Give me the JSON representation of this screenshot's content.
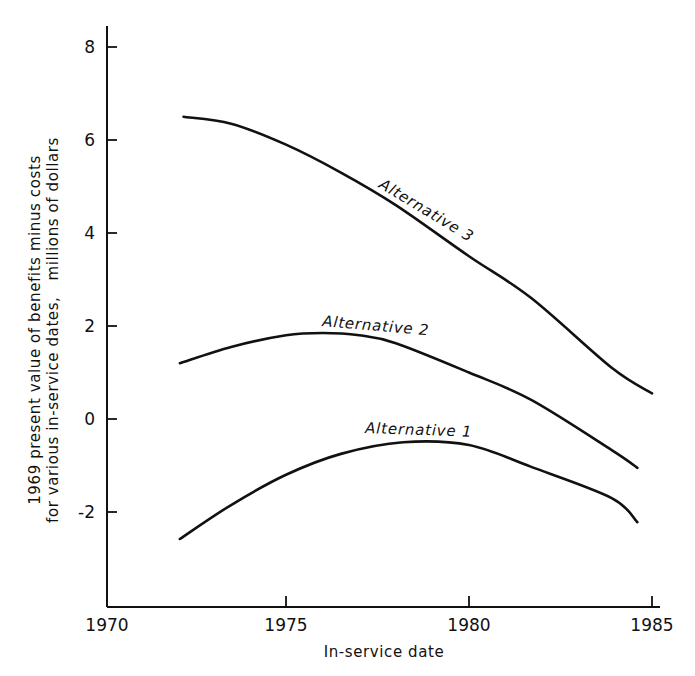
{
  "chart_data": {
    "type": "line",
    "title": "",
    "xlabel": "In-service date",
    "ylabel": [
      "1969 present value of benefits minus costs",
      "for various in-service dates,   millions of dollars"
    ],
    "xlim": [
      1970,
      1985
    ],
    "ylim": [
      -4,
      8.5
    ],
    "x_ticks": [
      1970,
      1975,
      1980,
      1985
    ],
    "x_tick_labels": [
      "1970",
      "1975",
      "1980",
      "1985"
    ],
    "y_ticks": [
      8,
      6,
      4,
      2,
      0,
      -2
    ],
    "y_tick_labels": [
      "8",
      "6",
      "4",
      "2",
      "0",
      "-2"
    ],
    "grid": false,
    "legend": "inline labels on curves",
    "series": [
      {
        "name": "Alternative 3",
        "x": [
          1972.2,
          1973.5,
          1975.0,
          1976.5,
          1978.0,
          1980.0,
          1981.7,
          1983.9,
          1985.0
        ],
        "values": [
          6.5,
          6.35,
          5.9,
          5.3,
          4.6,
          3.5,
          2.6,
          1.1,
          0.55
        ]
      },
      {
        "name": "Alternative 2",
        "x": [
          1972.1,
          1973.5,
          1975.0,
          1976.0,
          1977.0,
          1978.0,
          1980.0,
          1981.7,
          1983.9,
          1984.6
        ],
        "values": [
          1.2,
          1.55,
          1.8,
          1.85,
          1.8,
          1.63,
          1.0,
          0.41,
          -0.67,
          -1.05
        ]
      },
      {
        "name": "Alternative 1",
        "x": [
          1972.1,
          1973.5,
          1975.0,
          1976.5,
          1978.2,
          1980.0,
          1981.7,
          1983.9,
          1984.6
        ],
        "values": [
          -2.58,
          -1.85,
          -1.2,
          -0.75,
          -0.5,
          -0.56,
          -1.03,
          -1.7,
          -2.22
        ]
      }
    ],
    "annotations": [
      {
        "text": "Alternative 3",
        "series": "Alternative 3"
      },
      {
        "text": "Alternative 2",
        "series": "Alternative 2"
      },
      {
        "text": "Alternative 1",
        "series": "Alternative 1"
      }
    ]
  },
  "layout": {
    "plot": {
      "x0_px": 103,
      "x_per_year": 36.6,
      "y0_px": 419,
      "y_per_unit": 46.5,
      "axis_left_px": 107,
      "axis_bottom_px": 607,
      "axis_top_px": 26
    },
    "labels": [
      {
        "x": 378,
        "y": 187,
        "angle": 31
      },
      {
        "x": 322,
        "y": 326,
        "angle": 5
      },
      {
        "x": 365,
        "y": 433,
        "angle": 2
      }
    ],
    "line_color": "#111111",
    "background": "#ffffff"
  }
}
